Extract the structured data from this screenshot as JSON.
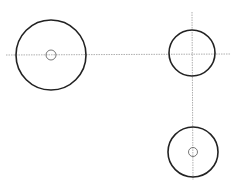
{
  "canvas": {
    "width": 245,
    "height": 186,
    "background": "#ffffff"
  },
  "colors": {
    "outline": "#222222",
    "centerline": "#9a9a9a",
    "hole": "#555555"
  },
  "centerlines": [
    {
      "id": "horizontal",
      "x1": 6,
      "y1": 55,
      "x2": 231,
      "y2": 54
    },
    {
      "id": "vertical",
      "x1": 192,
      "y1": 12,
      "x2": 193,
      "y2": 180
    }
  ],
  "circles": [
    {
      "id": "large-left",
      "cx": 51,
      "cy": 55,
      "r": 35,
      "hole_r": 5
    },
    {
      "id": "right-top",
      "cx": 192,
      "cy": 53,
      "r": 23,
      "hole_r": 0
    },
    {
      "id": "right-bottom",
      "cx": 193,
      "cy": 152,
      "r": 25,
      "hole_r": 4.5
    }
  ]
}
